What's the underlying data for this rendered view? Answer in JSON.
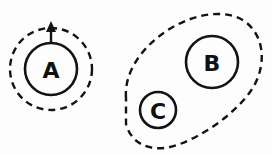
{
  "diagram": {
    "background_color": "#fdfdfd",
    "stroke_color": "#131313",
    "nodes": [
      {
        "id": "A",
        "label": "A",
        "shape": "circle",
        "style": "solid",
        "cx": 51,
        "cy": 69,
        "r": 26,
        "label_x": 51,
        "label_y": 70
      },
      {
        "id": "B",
        "label": "B",
        "shape": "circle",
        "style": "solid",
        "cx": 212,
        "cy": 62,
        "r": 26,
        "label_x": 212,
        "label_y": 63
      },
      {
        "id": "C",
        "label": "C",
        "shape": "circle",
        "style": "solid",
        "cx": 158,
        "cy": 110,
        "r": 18,
        "label_x": 158,
        "label_y": 111
      }
    ],
    "regions": [
      {
        "id": "region-around-a",
        "shape": "circle",
        "style": "dashed",
        "cx": 51,
        "cy": 69,
        "r": 41,
        "contains": [
          "A"
        ]
      },
      {
        "id": "region-around-bc",
        "shape": "blob",
        "style": "dashed",
        "contains": [
          "B",
          "C"
        ],
        "path": "M 126 98 C 124 74 140 48 168 30 C 196 12 230 8 248 24 C 266 40 266 70 250 92 C 234 114 206 134 180 144 C 154 154 132 146 126 124 Z"
      }
    ],
    "arrows": [
      {
        "id": "arrow-a-up",
        "from": "A",
        "direction": "up",
        "x1": 51,
        "y1": 44,
        "x2": 51,
        "y2": 26,
        "head_points": "51,21 46,32 56,32"
      }
    ],
    "dash_pattern": "7 5",
    "stroke_width": 2.5
  }
}
